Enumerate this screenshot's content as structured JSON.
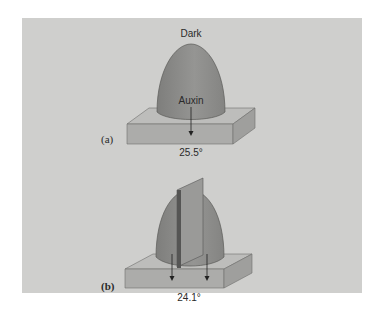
{
  "figure": {
    "panel_a": {
      "label": "(a)",
      "top_label": "Dark",
      "arrow_label": "Auxin",
      "value": "25.5°"
    },
    "panel_b": {
      "label": "(b)",
      "value": "24.1°"
    }
  },
  "colors": {
    "background": "#ffffff",
    "panel": "#cfcfcd",
    "coleoptile": "#8c8c8a",
    "block_top": "#bdbdbb",
    "block_front": "#acacaa",
    "block_side": "#9f9f9d",
    "barrier": "#5f5f5e"
  }
}
